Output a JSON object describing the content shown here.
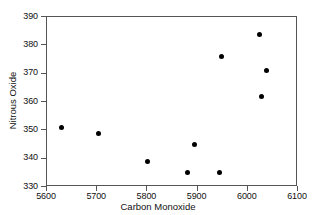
{
  "chart_data": {
    "type": "scatter",
    "title": "",
    "xlabel": "Carbon Monoxide",
    "ylabel": "Nitrous Oxide",
    "xlim": [
      5600,
      6100
    ],
    "ylim": [
      330,
      390
    ],
    "xticks": [
      5600,
      5700,
      5800,
      5900,
      6000,
      6100
    ],
    "yticks": [
      330,
      340,
      350,
      360,
      370,
      380,
      390
    ],
    "xtick_labels": [
      "5600",
      "5700",
      "5800",
      "5900",
      "6000",
      "6100"
    ],
    "ytick_labels": [
      "330",
      "340",
      "350",
      "360",
      "370",
      "380",
      "390"
    ],
    "grid": false,
    "legend": false,
    "marker": "filled-circle",
    "marker_color": "#000000",
    "frame_color": "#555555",
    "background_color": "#ffffff",
    "points": [
      {
        "x": 5628,
        "y": 351
      },
      {
        "x": 5702,
        "y": 349
      },
      {
        "x": 5801,
        "y": 339
      },
      {
        "x": 5879,
        "y": 335
      },
      {
        "x": 5893,
        "y": 345
      },
      {
        "x": 5944,
        "y": 335
      },
      {
        "x": 5948,
        "y": 376
      },
      {
        "x": 6024,
        "y": 384
      },
      {
        "x": 6028,
        "y": 362
      },
      {
        "x": 6038,
        "y": 371
      }
    ]
  }
}
